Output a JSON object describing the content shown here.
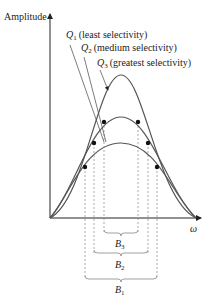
{
  "diagram": {
    "y_axis_label": "Amplitude",
    "x_axis_label": "ω",
    "curves": [
      {
        "id": "Q1",
        "symbol": "Q",
        "sub": "1",
        "description": "(least selectivity)"
      },
      {
        "id": "Q2",
        "symbol": "Q",
        "sub": "2",
        "description": "(medium selectivity)"
      },
      {
        "id": "Q3",
        "symbol": "Q",
        "sub": "3",
        "description": "(greatest selectivity)"
      }
    ],
    "bandwidths": [
      {
        "symbol": "B",
        "sub": "3"
      },
      {
        "symbol": "B",
        "sub": "2"
      },
      {
        "symbol": "B",
        "sub": "1"
      }
    ],
    "colors": {
      "curve": "#555555",
      "axis": "#222222",
      "dashed": "#888888",
      "dot": "#111111"
    }
  }
}
